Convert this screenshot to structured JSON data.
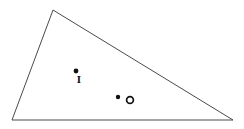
{
  "figure": {
    "type": "geometry-diagram",
    "width": 244,
    "height": 129,
    "background_color": "#FFFFFF",
    "line_color": "#4A4A4A",
    "marker_color": "#111111",
    "label_color": "#111111",
    "stroke_width": 1
  },
  "triangle": {
    "name": "triangle",
    "vertices": [
      {
        "name": "apex",
        "x": 53,
        "y": 10
      },
      {
        "name": "bottom-right",
        "x": 233,
        "y": 120
      },
      {
        "name": "bottom-left",
        "x": 12,
        "y": 120
      }
    ],
    "path": "M 53 10 L 233 120 L 12 120 Z",
    "edges": [
      {
        "name": "edge-apex-to-bottom-right",
        "from": "apex",
        "to": "bottom-right"
      },
      {
        "name": "edge-bottom-right-to-bottom-left",
        "from": "bottom-right",
        "to": "bottom-left"
      },
      {
        "name": "edge-bottom-left-to-apex",
        "from": "bottom-left",
        "to": "apex"
      }
    ]
  },
  "points": [
    {
      "id": "point-i",
      "label": "I",
      "marker": "filled-dot",
      "dot": {
        "x": 76,
        "y": 71,
        "r": 2.4
      },
      "label_pos": {
        "x": 79,
        "y": 80
      },
      "label_size": 11
    },
    {
      "id": "point-o",
      "label": "O",
      "marker": "filled-dot-with-ring",
      "dot": {
        "x": 118,
        "y": 97,
        "r": 2.2
      },
      "ring": {
        "x": 130,
        "y": 100,
        "r": 3.4,
        "stroke_width": 1.7
      },
      "label_pos": {
        "x": 130,
        "y": 100
      },
      "label_size": 10
    }
  ]
}
